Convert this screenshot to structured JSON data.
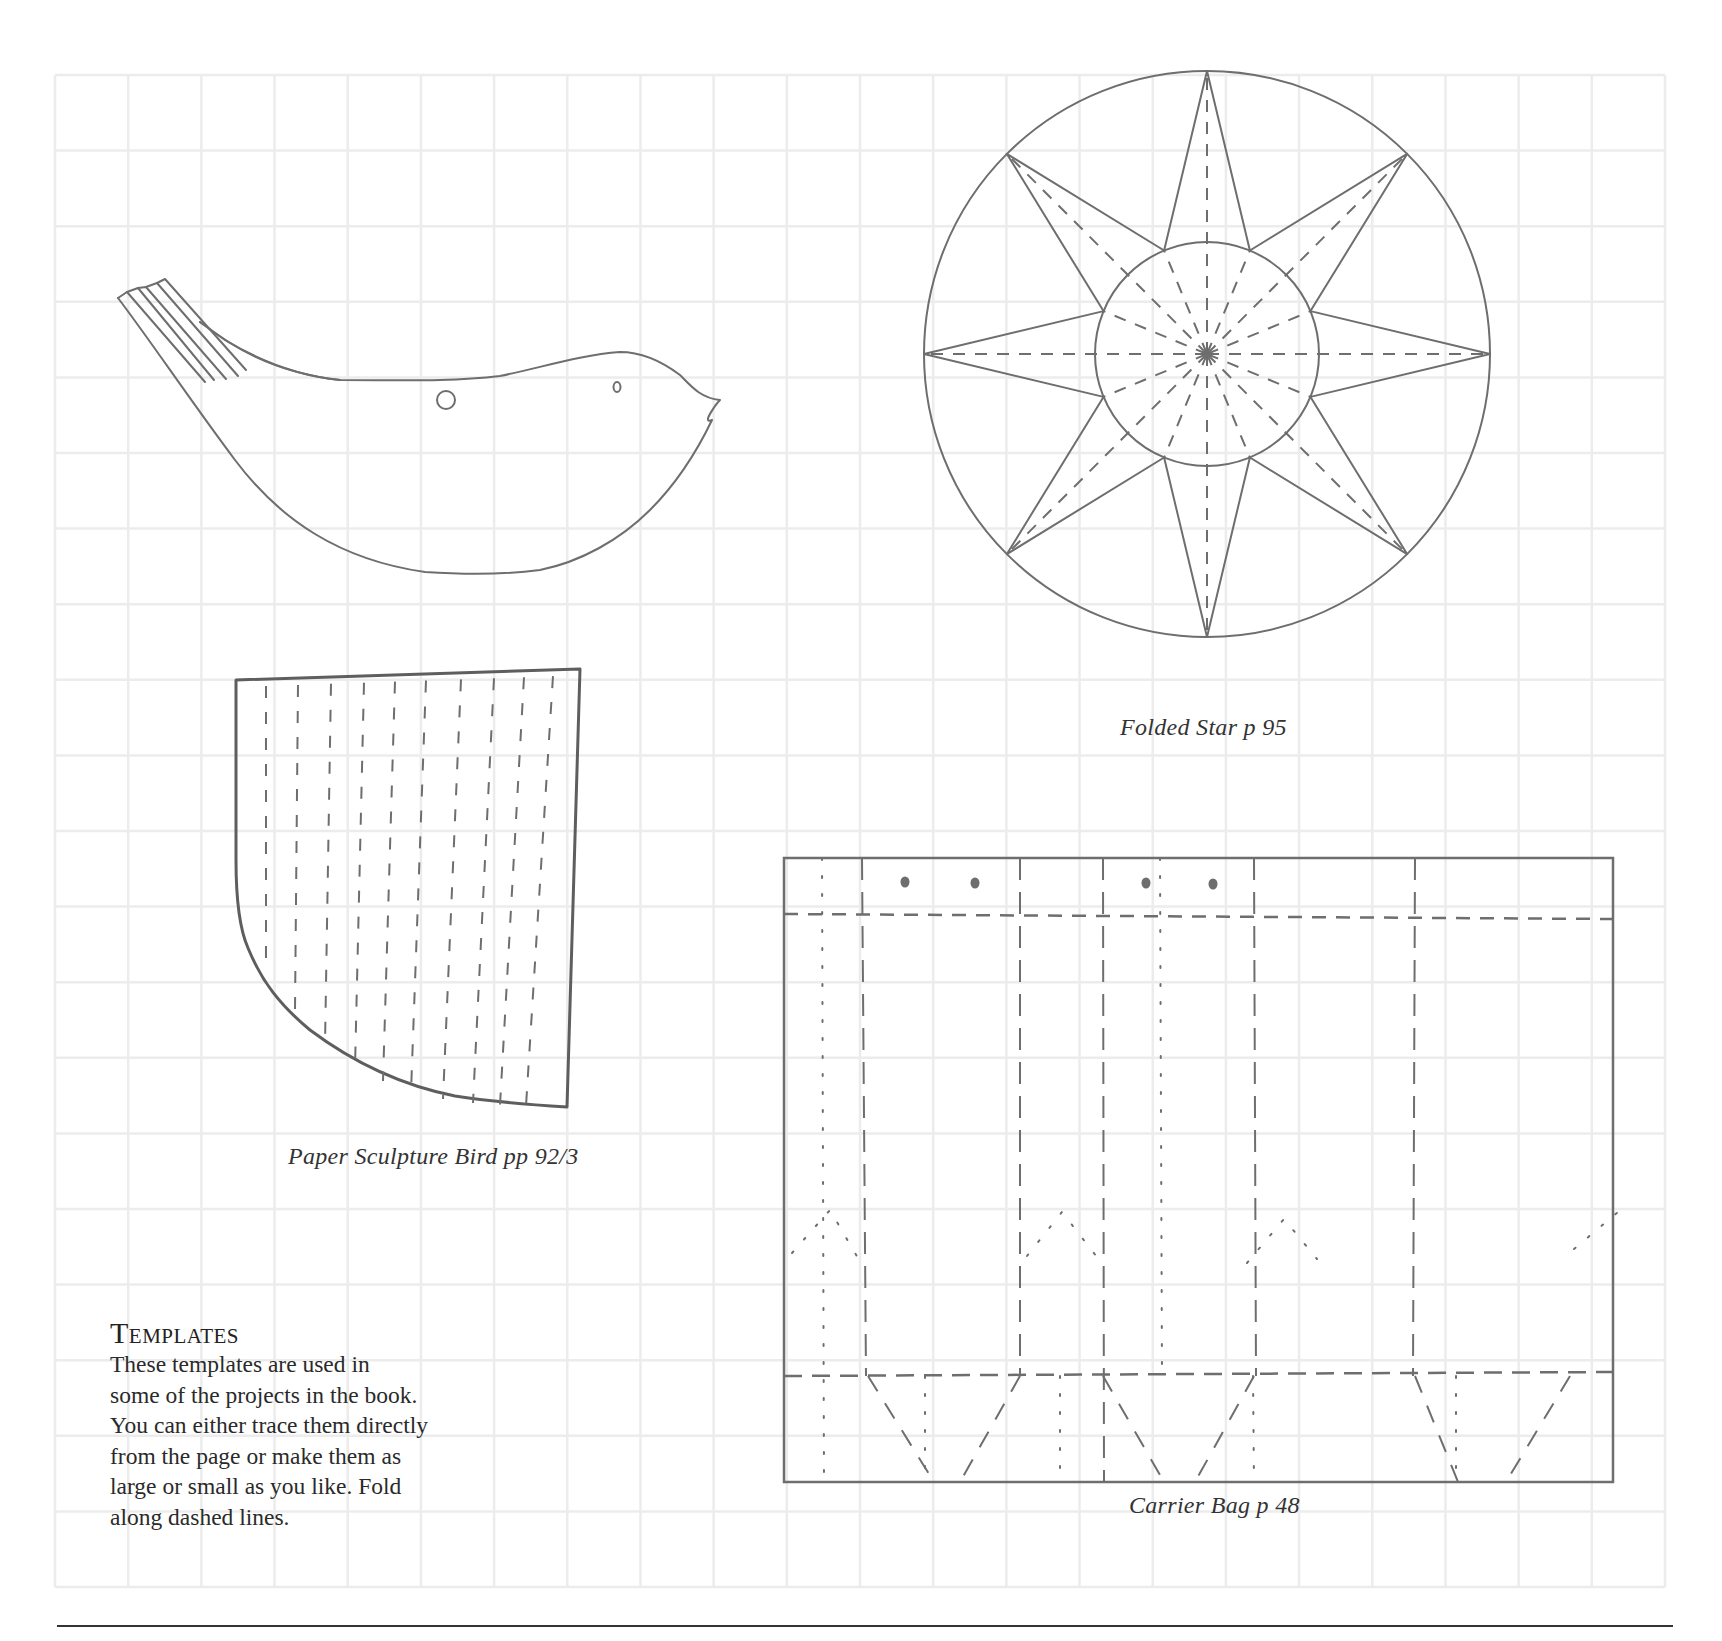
{
  "page": {
    "section": {
      "heading": "Templates",
      "body": "These templates are used in some of the projects in the book. You can either trace them directly from the page or make them as large or small as you like. Fold along dashed lines.",
      "body_lines": [
        "These templates are used in",
        "some of the projects in the book.",
        "You can either trace them directly",
        "from the page or make them as",
        "large or small as you like. Fold",
        "along dashed lines."
      ]
    },
    "templates": [
      {
        "name": "Paper Sculpture Bird",
        "caption": "Paper Sculpture Bird  pp 92/3",
        "pages": "pp 92/3"
      },
      {
        "name": "Folded Star",
        "caption": "Folded Star  p 95",
        "pages": "p 95"
      },
      {
        "name": "Carrier Bag",
        "caption": "Carrier Bag  p 48",
        "pages": "p 48"
      }
    ]
  },
  "style": {
    "grid_color": "#ececec",
    "line_color": "#6e6e6e",
    "rule_color": "#333333"
  }
}
